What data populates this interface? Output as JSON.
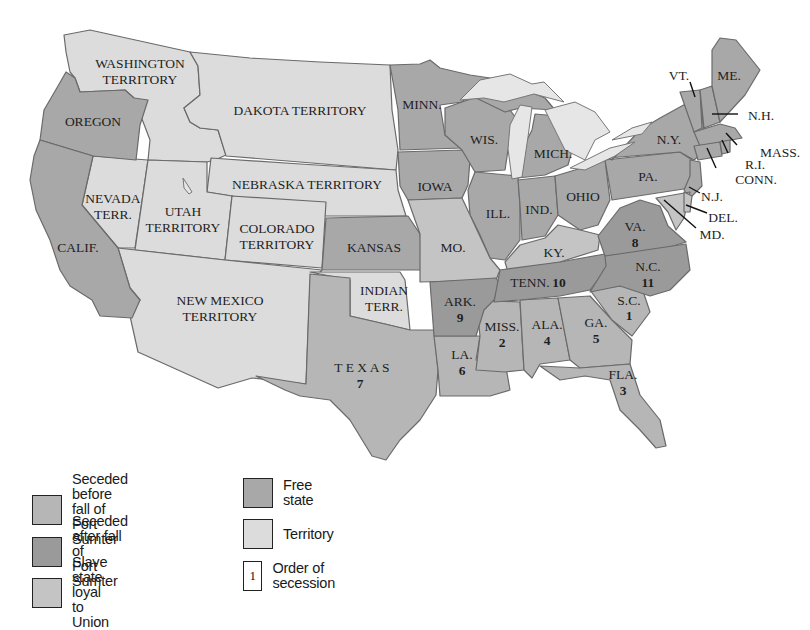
{
  "colors": {
    "seceded_before": "#b6b6b6",
    "seceded_after": "#9a9a9a",
    "slave_loyal": "#c4c4c4",
    "free_state": "#a8a8a8",
    "territory": "#dcdcdc",
    "lake": "#e8e8e8",
    "background": "#ffffff"
  },
  "map": {
    "territories": {
      "washington": [
        "WASHINGTON",
        "TERRITORY"
      ],
      "dakota": "DAKOTA TERRITORY",
      "nebraska": "NEBRASKA TERRITORY",
      "nevada": [
        "NEVADA",
        "TERR."
      ],
      "utah": [
        "UTAH",
        "TERRITORY"
      ],
      "colorado": [
        "COLORADO",
        "TERRITORY"
      ],
      "new_mexico": [
        "NEW MEXICO",
        "TERRITORY"
      ],
      "indian": [
        "INDIAN",
        "TERR."
      ]
    },
    "free_states": {
      "oregon": "OREGON",
      "calif": "CALIF.",
      "minn": "MINN.",
      "iowa": "IOWA",
      "kansas": "KANSAS",
      "wis": "WIS.",
      "mich": "MICH.",
      "ill": "ILL.",
      "ind": "IND.",
      "ohio": "OHIO",
      "pa": "PA.",
      "ny": "N.Y.",
      "vt": "VT.",
      "me": "ME.",
      "nh": "N.H.",
      "mass": "MASS.",
      "ri": "R.I.",
      "conn": "CONN.",
      "nj": "N.J."
    },
    "slave_loyal_states": {
      "mo": "MO.",
      "ky": "KY.",
      "del": "DEL.",
      "md": "MD."
    },
    "seceded_states": [
      {
        "key": "sc",
        "label": "S.C.",
        "order": "1",
        "group": "before"
      },
      {
        "key": "miss",
        "label": "MISS.",
        "order": "2",
        "group": "before"
      },
      {
        "key": "fla",
        "label": "FLA.",
        "order": "3",
        "group": "before"
      },
      {
        "key": "ala",
        "label": "ALA.",
        "order": "4",
        "group": "before"
      },
      {
        "key": "ga",
        "label": "GA.",
        "order": "5",
        "group": "before"
      },
      {
        "key": "la",
        "label": "LA.",
        "order": "6",
        "group": "before"
      },
      {
        "key": "texas",
        "label": "T E X A S",
        "order": "7",
        "group": "before"
      },
      {
        "key": "va",
        "label": "VA.",
        "order": "8",
        "group": "after"
      },
      {
        "key": "ark",
        "label": "ARK.",
        "order": "9",
        "group": "after"
      },
      {
        "key": "tenn",
        "label": "TENN.",
        "order": "10",
        "group": "after"
      },
      {
        "key": "nc",
        "label": "N.C.",
        "order": "11",
        "group": "after"
      }
    ]
  },
  "legend": {
    "items": [
      {
        "key": "seceded_before",
        "line1": "Seceded before fall of",
        "line2": "Fort Sumter"
      },
      {
        "key": "seceded_after",
        "line1": "Seceded after fall of",
        "line2": "Fort Sumter"
      },
      {
        "key": "slave_loyal",
        "line1": "Slave state loyal to Union",
        "line2": ""
      },
      {
        "key": "free_state",
        "line1": "Free state",
        "line2": ""
      },
      {
        "key": "territory",
        "line1": "Territory",
        "line2": ""
      },
      {
        "key": "order",
        "line1": "Order of secession",
        "line2": "",
        "sample": "1"
      }
    ]
  }
}
